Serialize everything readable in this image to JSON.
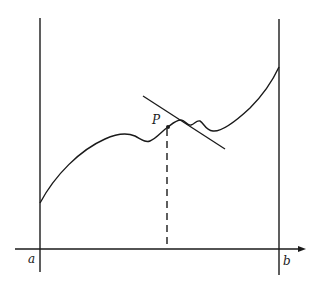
{
  "figure": {
    "type": "mean-value / tangent illustration",
    "labels": {
      "left_bound": "a",
      "right_bound": "b",
      "point": "P"
    },
    "colors": {
      "ink": "#1a1a1a",
      "background": "#ffffff"
    }
  }
}
